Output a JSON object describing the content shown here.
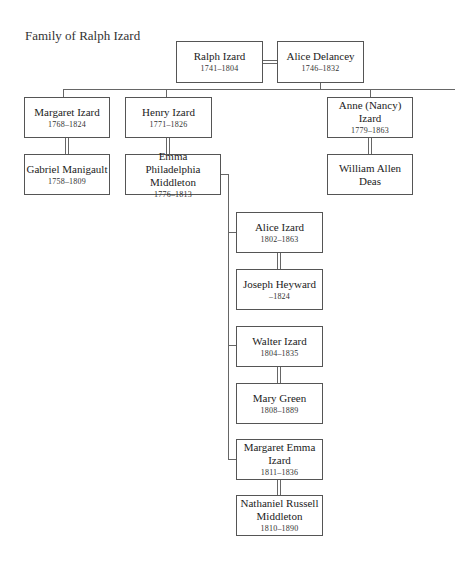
{
  "title": "Family of Ralph Izard",
  "people": {
    "ralph": {
      "name": "Ralph Izard",
      "dates": "1741–1804"
    },
    "alice_delancey": {
      "name": "Alice Delancey",
      "dates": "1746–1832"
    },
    "margaret": {
      "name": "Margaret Izard",
      "dates": "1768–1824"
    },
    "gabriel": {
      "name": "Gabriel Manigault",
      "dates": "1758–1809"
    },
    "henry": {
      "name": "Henry Izard",
      "dates": "1771–1826"
    },
    "emma": {
      "name": "Emma Philadelphia Middleton",
      "dates": "1776–1813"
    },
    "anne": {
      "name": "Anne (Nancy) Izard",
      "dates": "1779–1863"
    },
    "william": {
      "name": "William Allen Deas",
      "dates": ""
    },
    "alice_izard": {
      "name": "Alice Izard",
      "dates": "1802–1863"
    },
    "joseph": {
      "name": "Joseph Heyward",
      "dates": "–1824"
    },
    "walter": {
      "name": "Walter Izard",
      "dates": "1804–1835"
    },
    "mary": {
      "name": "Mary Green",
      "dates": "1808–1889"
    },
    "margaret_emma": {
      "name": "Margaret Emma Izard",
      "dates": "1811–1836"
    },
    "nathaniel": {
      "name": "Nathaniel Russell Middleton",
      "dates": "1810–1890"
    }
  },
  "relationships": [
    {
      "type": "marriage",
      "a": "Ralph Izard",
      "b": "Alice Delancey"
    },
    {
      "type": "marriage",
      "a": "Margaret Izard",
      "b": "Gabriel Manigault"
    },
    {
      "type": "marriage",
      "a": "Henry Izard",
      "b": "Emma Philadelphia Middleton"
    },
    {
      "type": "marriage",
      "a": "Anne (Nancy) Izard",
      "b": "William Allen Deas"
    },
    {
      "type": "marriage",
      "a": "Alice Izard",
      "b": "Joseph Heyward"
    },
    {
      "type": "marriage",
      "a": "Walter Izard",
      "b": "Mary Green"
    },
    {
      "type": "marriage",
      "a": "Margaret Emma Izard",
      "b": "Nathaniel Russell Middleton"
    },
    {
      "type": "children",
      "parents": [
        "Ralph Izard",
        "Alice Delancey"
      ],
      "children": [
        "Margaret Izard",
        "Henry Izard",
        "Anne (Nancy) Izard"
      ]
    },
    {
      "type": "children",
      "parents": [
        "Henry Izard",
        "Emma Philadelphia Middleton"
      ],
      "children": [
        "Alice Izard",
        "Walter Izard",
        "Margaret Emma Izard"
      ]
    }
  ]
}
